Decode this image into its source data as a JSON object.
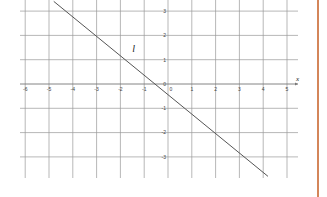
{
  "chart_data": {
    "type": "line",
    "title": "",
    "xlabel": "x",
    "ylabel": "",
    "xlim": [
      -6.3,
      5.5
    ],
    "ylim": [
      -3.8,
      3.4
    ],
    "grid": true,
    "x_ticks": [
      -6,
      -5,
      -4,
      -3,
      -2,
      -1,
      0,
      1,
      2,
      3,
      4,
      5
    ],
    "y_ticks": [
      3,
      2,
      1,
      0,
      -1,
      -2,
      -3
    ],
    "x_tick_labels": [
      "-6",
      "-5",
      "-4",
      "-3",
      "-2",
      "-1",
      "0",
      "1",
      "2",
      "3",
      "4",
      "5"
    ],
    "y_tick_labels": [
      "3",
      "2",
      "1",
      "0",
      "-1",
      "-2",
      "-3"
    ],
    "series": [
      {
        "name": "l",
        "x": [
          -4.8,
          4.2
        ],
        "y": [
          3.4,
          -3.8
        ],
        "color": "#555555"
      }
    ],
    "annotations": [
      {
        "text": "l",
        "x": -1.5,
        "y": 1.3
      }
    ]
  },
  "colors": {
    "grid": "#9a9a9a",
    "line": "#555555",
    "border": "#d4865a"
  }
}
